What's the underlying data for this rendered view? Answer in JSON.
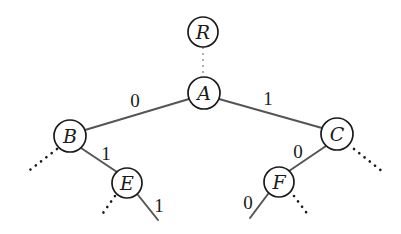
{
  "diagram": {
    "type": "binary-tree",
    "nodes": [
      {
        "id": "R",
        "label": "R",
        "x": 203,
        "y": 32,
        "r": 15
      },
      {
        "id": "A",
        "label": "A",
        "x": 204,
        "y": 93,
        "r": 16
      },
      {
        "id": "B",
        "label": "B",
        "x": 70,
        "y": 136,
        "r": 16
      },
      {
        "id": "C",
        "label": "C",
        "x": 337,
        "y": 134,
        "r": 16
      },
      {
        "id": "E",
        "label": "E",
        "x": 127,
        "y": 183,
        "r": 15
      },
      {
        "id": "F",
        "label": "F",
        "x": 279,
        "y": 182,
        "r": 15
      }
    ],
    "edges": [
      {
        "from": "R",
        "to": "A",
        "style": "dashed",
        "x1": 203,
        "y1": 47,
        "x2": 203,
        "y2": 77,
        "label": ""
      },
      {
        "from": "A",
        "to": "B",
        "style": "solid",
        "x1": 189,
        "y1": 99,
        "x2": 85,
        "y2": 130,
        "label": "0",
        "lx": 135,
        "ly": 107
      },
      {
        "from": "A",
        "to": "C",
        "style": "solid",
        "x1": 219,
        "y1": 99,
        "x2": 322,
        "y2": 128,
        "label": "1",
        "lx": 268,
        "ly": 105
      },
      {
        "from": "B",
        "to": "E",
        "style": "solid",
        "x1": 81,
        "y1": 148,
        "x2": 117,
        "y2": 172,
        "label": "1",
        "lx": 106,
        "ly": 160
      },
      {
        "from": "C",
        "to": "F",
        "style": "solid",
        "x1": 326,
        "y1": 146,
        "x2": 289,
        "y2": 171,
        "label": "0",
        "lx": 298,
        "ly": 158
      },
      {
        "from": "E",
        "to": "leaf",
        "style": "solid",
        "x1": 138,
        "y1": 195,
        "x2": 158,
        "y2": 220,
        "label": "1",
        "lx": 159,
        "ly": 212
      },
      {
        "from": "F",
        "to": "leaf",
        "style": "solid",
        "x1": 268,
        "y1": 194,
        "x2": 250,
        "y2": 218,
        "label": "0",
        "lx": 248,
        "ly": 209
      },
      {
        "from": "B",
        "to": "omitted",
        "style": "dotted",
        "x1": 57,
        "y1": 149,
        "x2": 26,
        "y2": 173,
        "label": ""
      },
      {
        "from": "E",
        "to": "omitted",
        "style": "dotted",
        "x1": 115,
        "y1": 196,
        "x2": 101,
        "y2": 216,
        "label": ""
      },
      {
        "from": "C",
        "to": "omitted",
        "style": "dotted",
        "x1": 354,
        "y1": 149,
        "x2": 383,
        "y2": 172,
        "label": ""
      },
      {
        "from": "F",
        "to": "omitted",
        "style": "dotted",
        "x1": 294,
        "y1": 196,
        "x2": 309,
        "y2": 216,
        "label": ""
      }
    ]
  }
}
